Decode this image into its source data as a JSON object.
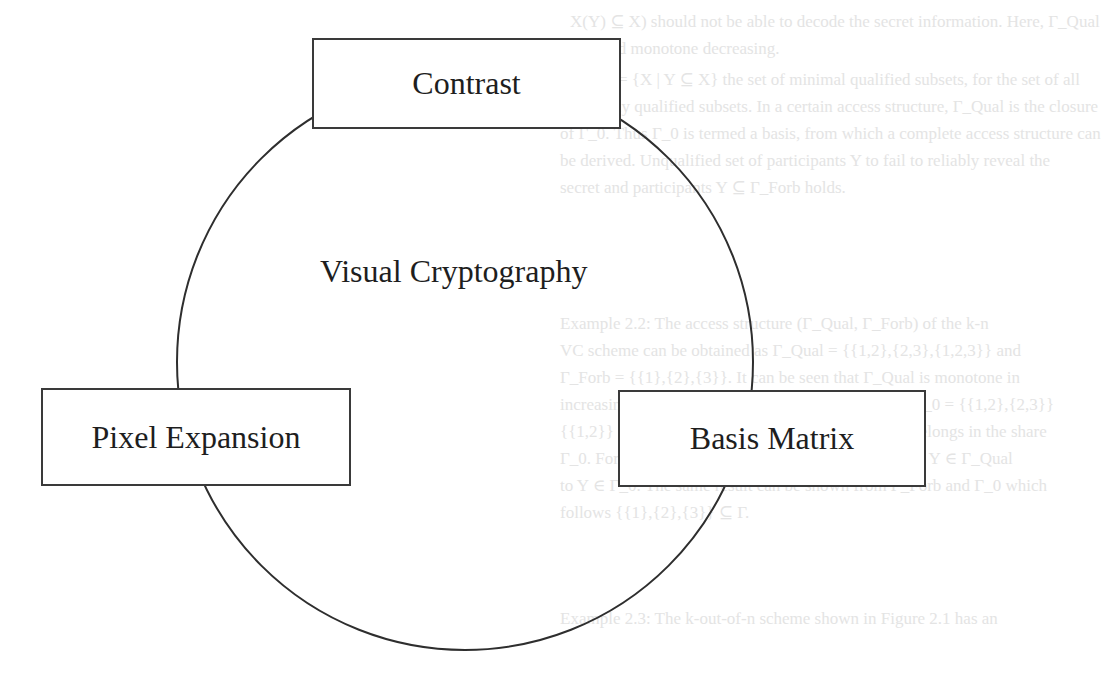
{
  "diagram": {
    "center_label": "Visual Cryptography",
    "nodes": [
      {
        "id": "contrast",
        "label": "Contrast"
      },
      {
        "id": "pixel-expansion",
        "label": "Pixel Expansion"
      },
      {
        "id": "basis-matrix",
        "label": "Basis Matrix"
      }
    ]
  },
  "background_text": {
    "lines": [
      "X(Y) ⊆ X) should not be able to decode the secret information. Here, Γ_Qual",
      "is called monotone decreasing.",
      "Let Γ_0 = {X | Y ⊆ X} the set of minimal qualified subsets, for the set of all",
      "minimally qualified subsets. In a certain access structure, Γ_Qual is the closure",
      "of Γ_0. Thus Γ_0 is termed a basis, from which a complete access structure can",
      "be derived. Unqualified set of participants Y to fail to reliably reveal the",
      "secret and participants Y ⊆ Γ_Forb holds.",
      "Example 2.2: The access structure (Γ_Qual, Γ_Forb) of the k-n",
      "VC scheme can be obtained as Γ_Qual = {{1,2},{2,3},{1,2,3}} and",
      "Γ_Forb = {{1},{2},{3}}. It can be seen that Γ_Qual is monotone in",
      "increasing and Γ_Forb is monotone decreasing. Let Γ_0 = {{1,2},{2,3}}",
      "{{1,2}} ⊆ X ⊆ P as Y ∈ Γ_Qual. It follows that X belongs in the share",
      "Γ_0. For set X = {1,2,3} Γ_Qual, and X ⊆ Y satisfies Y ∈ Γ_Qual",
      "to Y ∈ Γ_0. The same result can be shown from Γ_Forb and Γ_0 which",
      "follows {{1},{2},{3}} ⊆ Γ.",
      "Example 2.3: The k-out-of-n scheme shown in Figure 2.1 has an"
    ]
  }
}
